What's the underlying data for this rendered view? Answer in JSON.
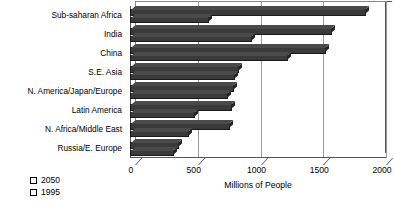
{
  "chart_data": {
    "type": "bar",
    "orientation": "horizontal",
    "title": "",
    "xlabel": "Millions of People",
    "ylabel": "",
    "xlim": [
      0,
      2000
    ],
    "xticks": [
      0,
      500,
      1000,
      1500,
      2000
    ],
    "grid": true,
    "legend_position": "bottom-left",
    "categories": [
      "Sub-saharan Africa",
      "India",
      "China",
      "S.E. Asia",
      "N. America/Japan/Europe",
      "Latin America",
      "N. Africa/Middle East",
      "Russia/E. Europe"
    ],
    "series": [
      {
        "name": "2050",
        "color": "#3a3a3a",
        "values": [
          1840,
          1570,
          1520,
          830,
          790,
          770,
          760,
          350
        ]
      },
      {
        "name": "1995",
        "color": "#3a3a3a",
        "values": [
          590,
          930,
          1220,
          800,
          740,
          480,
          430,
          310
        ]
      }
    ]
  },
  "axis": {
    "x_title": "Millions of People",
    "tick_labels": [
      "0",
      "500",
      "1000",
      "1500",
      "2000"
    ]
  },
  "legend": {
    "items": [
      {
        "label": "2050"
      },
      {
        "label": "1995"
      }
    ]
  },
  "caption": {
    "text": ""
  }
}
